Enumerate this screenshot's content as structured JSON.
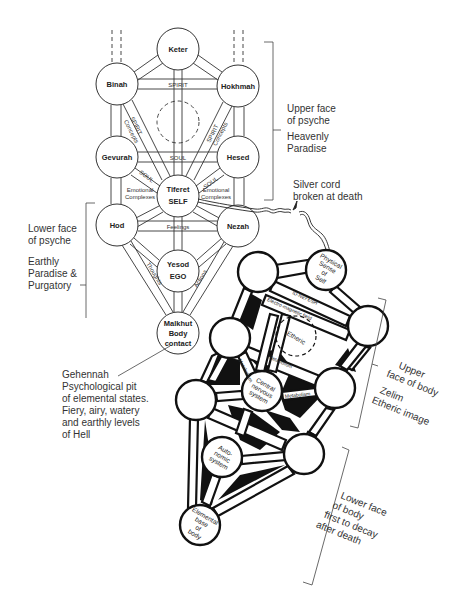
{
  "psyche_tree": {
    "nodes": {
      "keter": {
        "lines": [
          "Keter"
        ]
      },
      "binah": {
        "lines": [
          "Binah"
        ]
      },
      "hokhmah": {
        "lines": [
          "Hokhmah"
        ]
      },
      "gevurah": {
        "lines": [
          "Gevurah"
        ]
      },
      "hesed": {
        "lines": [
          "Hesed"
        ]
      },
      "tiferet": {
        "line1": "Tiferet",
        "line2": "SELF"
      },
      "hod": {
        "lines": [
          "Hod"
        ]
      },
      "nezah": {
        "lines": [
          "Nezah"
        ]
      },
      "yesod": {
        "line1": "Yesod",
        "line2": "EGO"
      },
      "malkhut": {
        "line1": "Malkhut",
        "line2": "Body",
        "line3": "contact"
      }
    },
    "paths": {
      "spirit": "SPIRIT",
      "spirit_concepts_left": {
        "line1": "SPIRIT",
        "line2": "Concepts"
      },
      "spirit_concepts_right": {
        "line1": "SPIRIT",
        "line2": "Concepts"
      },
      "soul": "SOUL",
      "soul_left": "SOUL",
      "soul_right": "SOUL",
      "emotional_left": {
        "line1": "Emotional",
        "line2": "Complexes"
      },
      "emotional_right": {
        "line1": "Emotional",
        "line2": "Complexes"
      },
      "feelings": "Feelings",
      "thoughts": "Thoughts",
      "actions": "Actions"
    }
  },
  "body_tree": {
    "nodes": {
      "physical_sense": {
        "line1": "Physical",
        "line2": "Sense",
        "line3": "of",
        "line4": "Self"
      },
      "etheric": "Etheric",
      "central_nervous": {
        "line1": "Central",
        "line2": "nervous",
        "line3": "system"
      },
      "autonomic": {
        "line1": "Auto-",
        "line2": "nomic",
        "line3": "system"
      },
      "elemental_base": {
        "line1": "Elemental",
        "line2": "base",
        "line3": "of",
        "line4": "body"
      }
    },
    "paths": {
      "id_nefesh": "ID-NEFESH",
      "electro_magnetic": "Electro-magnetic field",
      "metabolism_left": "Metabolism",
      "metabolism_center": "Metabolism",
      "metabolism_right": "Metabolism"
    }
  },
  "annotations": {
    "upper_psyche": {
      "line1": "Upper face",
      "line2": "of psyche",
      "line3": "Heavenly",
      "line4": "Paradise"
    },
    "lower_psyche": {
      "line1": "Lower face",
      "line2": "of psyche",
      "line3": "Earthly",
      "line4": "Paradise &",
      "line5": "Purgatory"
    },
    "silver_cord": {
      "line1": "Silver cord",
      "line2": "broken at death"
    },
    "gehennah": {
      "line1": "Gehennah",
      "line2": "Psychological pit",
      "line3": "of elemental states.",
      "line4": "Fiery, airy, watery",
      "line5": "and earthly levels",
      "line6": "of Hell"
    },
    "upper_body": {
      "line1": "Upper",
      "line2": "face of body",
      "line3": "Zelim",
      "line4": "Etheric image"
    },
    "lower_body": {
      "line1": "Lower face",
      "line2": "of body",
      "line3": "first to decay",
      "line4": "after death"
    }
  },
  "colors": {
    "ink": "#222222",
    "background": "#ffffff",
    "fill_dark": "#111111"
  }
}
